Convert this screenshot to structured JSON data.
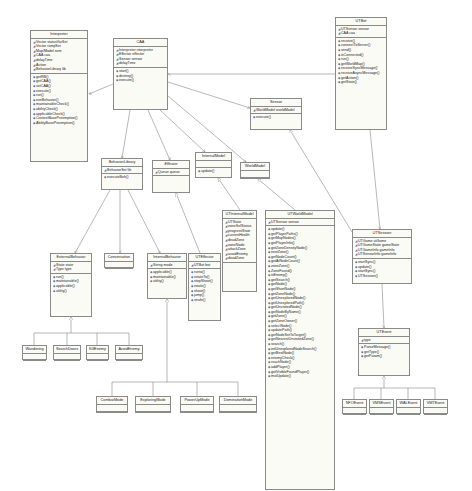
{
  "diagram": {
    "type": "UML class diagram",
    "classes": [
      {
        "id": "interpreter",
        "name": "Interpreter",
        "attrs": [
          "Vector statusVarSet",
          "Vector rampSet",
          "Map/Model sem",
          "CAA caa",
          "delayTime",
          "Action",
          "BehaviorLibrary lib"
        ],
        "ops": [
          "getRB()",
          "getCAA()",
          "setCAA()",
          "execute()",
          "run()",
          "exeBehavior()",
          "maintainableCheck()",
          "abilityCheck()",
          "applicableCheck()",
          "ContextBasePreemption()",
          "AbilityBasePreemption()"
        ]
      },
      {
        "id": "caa",
        "name": "CAA",
        "attrs": [
          "Interpreter interpreter",
          "Effector effector",
          "Sensor sensor",
          "delayTime"
        ],
        "ops": [
          "start()",
          "destroy()",
          "execute()"
        ]
      },
      {
        "id": "utbot",
        "name": "UTBot",
        "attrs": [
          "UTSensor sensor",
          "CAA caa"
        ],
        "ops": [
          "receive()",
          "connectToServer()",
          "send()",
          "isConnected()",
          "run()",
          "getWorldMap()",
          "receiveSyncMessage()",
          "receiveAsyncMessage()",
          "getAction()",
          "getState()"
        ]
      },
      {
        "id": "sensor",
        "name": "Sensor",
        "attrs": [
          "WorldModel worldModel"
        ],
        "ops": [
          "execute()"
        ]
      },
      {
        "id": "behaviorlibrary",
        "name": "BehaviorLibrary",
        "attrs": [
          "BehaviorSet lib"
        ],
        "ops": [
          "executeBeh()"
        ]
      },
      {
        "id": "effector",
        "name": "Effector",
        "italic": true,
        "attrs": [
          "Queue queue"
        ],
        "ops": []
      },
      {
        "id": "internalmodel",
        "name": "InternalModel",
        "attrs": [],
        "ops": [
          "update()"
        ]
      },
      {
        "id": "worldmodel",
        "name": "WorldModel",
        "attrs": [],
        "ops": []
      },
      {
        "id": "utinternalmodel",
        "name": "UTInternalModel",
        "attrs": [
          "UTState",
          "zoneSelStatus",
          "progressState",
          "currentHealth",
          "deadZone",
          "zoneNode",
          "attackZone",
          "avoidEnemy",
          "deadZone"
        ],
        "ops": []
      },
      {
        "id": "utworldmodel",
        "name": "UTWorldModel",
        "attrs": [
          "UTSensor sensor"
        ],
        "ops": [
          "update()",
          "getPlayerPaths()",
          "getMapNodes()",
          "getPlayerInfo()",
          "getZoneDensityNode()",
          "nextZone()",
          "getNodeCount()",
          "getAtNodeCount()",
          "zoneZone()",
          "ZoneFound()",
          "isEnemy()",
          "getSearch()",
          "getNode()",
          "getShortNode()",
          "getZoneNode()",
          "getUnexploredNode()",
          "getUnexploredPath()",
          "getUnvisitedNode()",
          "getNodeByName()",
          "getZone()",
          "getZoneOwner()",
          "selectNode()",
          "updatePath()",
          "getNodeSetToTarget()",
          "getNearestUnvisitedZone()",
          "search()",
          "initUnexploredNodeSearch()",
          "getBestNode()",
          "enemyCheck()",
          "reachNode()",
          "addPlayer()",
          "getVisibleFoundPlayer()",
          "mutUpdate()"
        ]
      },
      {
        "id": "utsession",
        "name": "UTSession",
        "attrs": [
          "UTGame utGame",
          "UTGameState gameState",
          "UTGameInfo gameInfo",
          "UTSensorInfo gameInfo"
        ],
        "ops": [
          "startSync()",
          "update()",
          "startSync()",
          "UTSession()"
        ]
      },
      {
        "id": "utevent",
        "name": "UTEvent",
        "attrs": [
          "type"
        ],
        "ops": [
          "ParseMessage()",
          "getType()",
          "getParam()"
        ]
      },
      {
        "id": "externalbehavior",
        "name": "ExternalBehavior",
        "attrs": [
          "State state",
          "Type type"
        ],
        "ops": [
          "run()",
          "maintainable()",
          "applicable()",
          "utility()"
        ]
      },
      {
        "id": "conversation",
        "name": "Conversation",
        "attrs": [],
        "ops": []
      },
      {
        "id": "internalbehavior",
        "name": "InternalBehavior",
        "attrs": [
          "String mode"
        ],
        "ops": [
          "applicable()",
          "maintainable()",
          "utility()"
        ]
      },
      {
        "id": "uteffector",
        "name": "UTEffector",
        "attrs": [
          "UTBot bot"
        ],
        "ops": [
          "runto()",
          "rotateTo()",
          "stopShoot()",
          "rotate()",
          "shoot()",
          "jump()",
          "strafe()"
        ]
      },
      {
        "id": "wandering",
        "name": "Wandering",
        "attrs": [],
        "ops": []
      },
      {
        "id": "searchdoors",
        "name": "SearchDoors",
        "attrs": [],
        "ops": []
      },
      {
        "id": "killenemy",
        "name": "KillEnemy",
        "attrs": [],
        "ops": []
      },
      {
        "id": "avoidenemy",
        "name": "AvoidEnemy",
        "attrs": [],
        "ops": []
      },
      {
        "id": "combatmode",
        "name": "CombatMode",
        "attrs": [],
        "ops": []
      },
      {
        "id": "exploringmode",
        "name": "ExploringMode",
        "attrs": [],
        "ops": []
      },
      {
        "id": "powerupmode",
        "name": "PowerUpMode",
        "attrs": [],
        "ops": []
      },
      {
        "id": "dominationmode",
        "name": "DominationMode",
        "attrs": [],
        "ops": []
      },
      {
        "id": "nfoevent",
        "name": "NFOEvent",
        "attrs": [],
        "ops": []
      },
      {
        "id": "vmsevent",
        "name": "VMSEvent",
        "attrs": [],
        "ops": []
      },
      {
        "id": "walevent",
        "name": "WALEvent",
        "attrs": [],
        "ops": []
      },
      {
        "id": "vmtevent",
        "name": "VMTEvent",
        "attrs": [],
        "ops": []
      }
    ],
    "relationships": [
      {
        "from": "caa",
        "to": "interpreter",
        "kind": "association"
      },
      {
        "from": "utbot",
        "to": "caa",
        "kind": "association"
      },
      {
        "from": "caa",
        "to": "sensor",
        "kind": "association"
      },
      {
        "from": "caa",
        "to": "behaviorlibrary",
        "kind": "association"
      },
      {
        "from": "caa",
        "to": "effector",
        "kind": "association"
      },
      {
        "from": "caa",
        "to": "internalmodel",
        "kind": "association"
      },
      {
        "from": "caa",
        "to": "worldmodel",
        "kind": "association"
      },
      {
        "from": "utbot",
        "to": "utsession",
        "kind": "association"
      },
      {
        "from": "utsession",
        "to": "sensor",
        "kind": "generalization"
      },
      {
        "from": "utsession",
        "to": "utevent",
        "kind": "association"
      },
      {
        "from": "behaviorlibrary",
        "to": "externalbehavior",
        "kind": "association"
      },
      {
        "from": "behaviorlibrary",
        "to": "conversation",
        "kind": "association"
      },
      {
        "from": "behaviorlibrary",
        "to": "internalbehavior",
        "kind": "association"
      },
      {
        "from": "uteffector",
        "to": "effector",
        "kind": "generalization"
      },
      {
        "from": "utinternalmodel",
        "to": "internalmodel",
        "kind": "generalization"
      },
      {
        "from": "utworldmodel",
        "to": "worldmodel",
        "kind": "generalization"
      },
      {
        "from": "wandering",
        "to": "externalbehavior",
        "kind": "generalization"
      },
      {
        "from": "searchdoors",
        "to": "externalbehavior",
        "kind": "generalization"
      },
      {
        "from": "killenemy",
        "to": "externalbehavior",
        "kind": "generalization"
      },
      {
        "from": "avoidenemy",
        "to": "externalbehavior",
        "kind": "generalization"
      },
      {
        "from": "combatmode",
        "to": "internalbehavior",
        "kind": "generalization"
      },
      {
        "from": "exploringmode",
        "to": "internalbehavior",
        "kind": "generalization"
      },
      {
        "from": "powerupmode",
        "to": "internalbehavior",
        "kind": "generalization"
      },
      {
        "from": "dominationmode",
        "to": "internalbehavior",
        "kind": "generalization"
      },
      {
        "from": "nfoevent",
        "to": "utevent",
        "kind": "generalization"
      },
      {
        "from": "vmsevent",
        "to": "utevent",
        "kind": "generalization"
      },
      {
        "from": "walevent",
        "to": "utevent",
        "kind": "generalization"
      },
      {
        "from": "vmtevent",
        "to": "utevent",
        "kind": "generalization"
      }
    ]
  },
  "layout": {
    "interpreter": {
      "x": 30,
      "y": 30,
      "w": 58,
      "h": 132
    },
    "caa": {
      "x": 113,
      "y": 38,
      "w": 55,
      "h": 72
    },
    "utbot": {
      "x": 335,
      "y": 17,
      "w": 52,
      "h": 113
    },
    "sensor": {
      "x": 250,
      "y": 98,
      "w": 52,
      "h": 32
    },
    "behaviorlibrary": {
      "x": 101,
      "y": 158,
      "w": 42,
      "h": 32
    },
    "effector": {
      "x": 152,
      "y": 160,
      "w": 38,
      "h": 33
    },
    "internalmodel": {
      "x": 195,
      "y": 152,
      "w": 37,
      "h": 26
    },
    "worldmodel": {
      "x": 240,
      "y": 162,
      "w": 30,
      "h": 17
    },
    "utinternalmodel": {
      "x": 222,
      "y": 210,
      "w": 35,
      "h": 82
    },
    "utworldmodel": {
      "x": 265,
      "y": 210,
      "w": 70,
      "h": 280
    },
    "utsession": {
      "x": 352,
      "y": 229,
      "w": 60,
      "h": 55
    },
    "utevent": {
      "x": 358,
      "y": 328,
      "w": 52,
      "h": 48
    },
    "externalbehavior": {
      "x": 50,
      "y": 253,
      "w": 42,
      "h": 64
    },
    "conversation": {
      "x": 104,
      "y": 253,
      "w": 30,
      "h": 15
    },
    "internalbehavior": {
      "x": 147,
      "y": 253,
      "w": 40,
      "h": 46
    },
    "uteffector": {
      "x": 188,
      "y": 253,
      "w": 33,
      "h": 68
    },
    "wandering": {
      "x": 22,
      "y": 345,
      "w": 25,
      "h": 15
    },
    "searchdoors": {
      "x": 53,
      "y": 345,
      "w": 28,
      "h": 15
    },
    "killenemy": {
      "x": 86,
      "y": 345,
      "w": 23,
      "h": 15
    },
    "avoidenemy": {
      "x": 115,
      "y": 345,
      "w": 28,
      "h": 15
    },
    "combatmode": {
      "x": 96,
      "y": 396,
      "w": 32,
      "h": 17
    },
    "exploringmode": {
      "x": 135,
      "y": 396,
      "w": 36,
      "h": 17
    },
    "powerupmode": {
      "x": 180,
      "y": 396,
      "w": 34,
      "h": 17
    },
    "dominationmode": {
      "x": 219,
      "y": 396,
      "w": 38,
      "h": 17
    },
    "nfoevent": {
      "x": 342,
      "y": 399,
      "w": 25,
      "h": 15
    },
    "vmsevent": {
      "x": 369,
      "y": 399,
      "w": 25,
      "h": 15
    },
    "walevent": {
      "x": 396,
      "y": 399,
      "w": 25,
      "h": 15
    },
    "vmtevent": {
      "x": 423,
      "y": 399,
      "w": 25,
      "h": 15
    }
  }
}
